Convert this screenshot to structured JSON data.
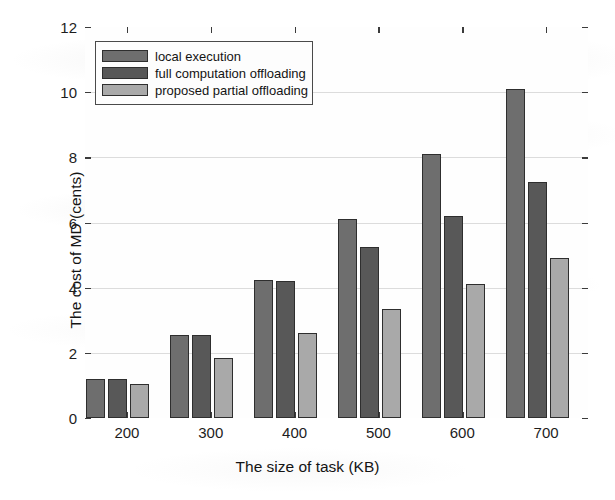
{
  "chart_data": {
    "type": "bar",
    "title": "",
    "xlabel": "The size of task (KB)",
    "ylabel": "The cost of MD (cents)",
    "categories": [
      "200",
      "300",
      "400",
      "500",
      "600",
      "700"
    ],
    "ylim": [
      0,
      12
    ],
    "yticks": [
      "0",
      "2",
      "4",
      "6",
      "8",
      "10",
      "12"
    ],
    "grid": true,
    "legend_position": "upper left",
    "series": [
      {
        "name": "local execution",
        "color": "#6e6e6e",
        "values": [
          1.2,
          2.55,
          4.25,
          6.1,
          8.1,
          10.1
        ]
      },
      {
        "name": "full computation offloading",
        "color": "#585858",
        "values": [
          1.2,
          2.55,
          4.2,
          5.25,
          6.2,
          7.25
        ]
      },
      {
        "name": "proposed partial offloading",
        "color": "#a9a9a9",
        "values": [
          1.05,
          1.85,
          2.6,
          3.35,
          4.1,
          4.9
        ]
      }
    ]
  }
}
